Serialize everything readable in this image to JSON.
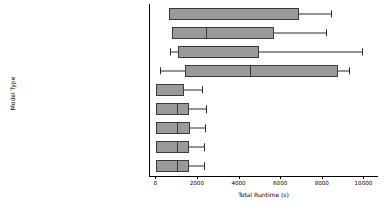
{
  "chart_data": {
    "type": "box",
    "orientation": "horizontal",
    "title": "",
    "xlabel": "Total Runtime (s)",
    "ylabel": "Model Type",
    "xlim": [
      -300,
      10700
    ],
    "xticks": [
      0,
      2000,
      4000,
      6000,
      8000,
      10000
    ],
    "xtick_labels": [
      "0",
      "2000",
      "4000",
      "6000",
      "8000",
      "10000"
    ],
    "grid": false,
    "legend": "none",
    "box_fill_color": "#9a9a9a",
    "box_edge_color": "#3a3a3a",
    "background_color": "#ffffff",
    "categories": [
      "LORA:microsoft/codebert-base",
      "LORA:bert-base-uncased",
      "Fine-Tuned LLM:microsoft/codebert-base",
      "Fine-Tuned LLM:bert-base-uncased",
      "DecisionTree",
      "RandomForest",
      "KNeighbours",
      "Bernoulli",
      "LogisticRegression"
    ],
    "boxes": [
      {
        "label": "LORA:microsoft/codebert-base",
        "whisker_low": 650,
        "q1": 650,
        "median": 650,
        "q3": 6900,
        "whisker_high": 8450
      },
      {
        "label": "LORA:bert-base-uncased",
        "whisker_low": 800,
        "q1": 800,
        "median": 2450,
        "q3": 5700,
        "whisker_high": 8200
      },
      {
        "label": "Fine-Tuned LLM:microsoft/codebert-base",
        "whisker_low": 700,
        "q1": 1100,
        "median": 1100,
        "q3": 5000,
        "whisker_high": 9950
      },
      {
        "label": "Fine-Tuned LLM:bert-base-uncased",
        "whisker_low": 250,
        "q1": 1450,
        "median": 4550,
        "q3": 8800,
        "whisker_high": 9300
      },
      {
        "label": "DecisionTree",
        "whisker_low": 30,
        "q1": 30,
        "median": 30,
        "q3": 1370,
        "whisker_high": 2250
      },
      {
        "label": "RandomForest",
        "whisker_low": 40,
        "q1": 40,
        "median": 1030,
        "q3": 1600,
        "whisker_high": 2450
      },
      {
        "label": "KNeighbours",
        "whisker_low": 40,
        "q1": 40,
        "median": 1030,
        "q3": 1650,
        "whisker_high": 2400
      },
      {
        "label": "Bernoulli",
        "whisker_low": 40,
        "q1": 40,
        "median": 1030,
        "q3": 1600,
        "whisker_high": 2350
      },
      {
        "label": "LogisticRegression",
        "whisker_low": 40,
        "q1": 40,
        "median": 1030,
        "q3": 1600,
        "whisker_high": 2350
      }
    ]
  }
}
